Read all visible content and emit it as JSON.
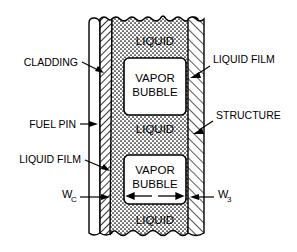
{
  "figure": {
    "background_color": "#ffffff",
    "line_color": "#000000"
  },
  "labels": {
    "cladding": "CLADDING",
    "fuel_pin": "FUEL  PIN",
    "liquid_film_left": "LIQUID  FILM",
    "liquid_film_right": "LIQUID  FILM",
    "structure": "STRUCTURE",
    "w_c_base": "W",
    "w_c_sub": "C",
    "w_3_base": "W",
    "w_3_sub": "3"
  },
  "channel": {
    "liquid_top": "LIQUID",
    "liquid_middle": "LIQUID",
    "liquid_bottom": "LIQUID",
    "bubble_upper_line1": "VAPOR",
    "bubble_upper_line2": "BUBBLE",
    "bubble_lower_line1": "VAPOR",
    "bubble_lower_line2": "BUBBLE"
  },
  "regions": {
    "fuel_pin_fill": "#ffffff",
    "cladding_fill": "#ffffff",
    "liquid_fill": "#ffffff",
    "structure_fill": "#ffffff",
    "bubble_fill": "#ffffff"
  }
}
